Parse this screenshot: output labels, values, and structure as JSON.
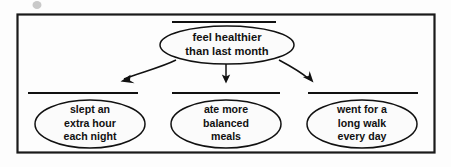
{
  "diagram": {
    "type": "cause-and-effect graphic organizer",
    "frame": {
      "shape": "rectangle",
      "border_color": "#1a1a1a",
      "background_color": "#fdfdfd"
    },
    "effect_node": {
      "id": "feel-healthier",
      "shape": "ellipse",
      "has_rule_above": true,
      "lines": [
        "feel healthier",
        "than last month"
      ]
    },
    "cause_nodes": [
      {
        "id": "slept-extra-hour",
        "shape": "ellipse",
        "has_rule_above": true,
        "lines": [
          "slept an",
          "extra hour",
          "each night"
        ]
      },
      {
        "id": "ate-balanced-meals",
        "shape": "ellipse",
        "has_rule_above": true,
        "lines": [
          "ate more",
          "balanced",
          "meals"
        ]
      },
      {
        "id": "went-long-walk",
        "shape": "ellipse",
        "has_rule_above": true,
        "lines": [
          "went for a",
          "long walk",
          "every day"
        ]
      }
    ],
    "connectors": [
      {
        "id": "arrow-to-slept",
        "from": "feel-healthier",
        "to": "slept-extra-hour",
        "style": "curved-arrow",
        "direction": "down-left"
      },
      {
        "id": "arrow-to-ate",
        "from": "feel-healthier",
        "to": "ate-balanced-meals",
        "style": "straight-arrow",
        "direction": "down"
      },
      {
        "id": "arrow-to-walk",
        "from": "feel-healthier",
        "to": "went-long-walk",
        "style": "curved-arrow",
        "direction": "down-right"
      }
    ],
    "colors": {
      "ink": "#111111",
      "frame": "#1a1a1a",
      "paper": "#fdfdfd",
      "node_fill": "#fbfbfb"
    }
  }
}
